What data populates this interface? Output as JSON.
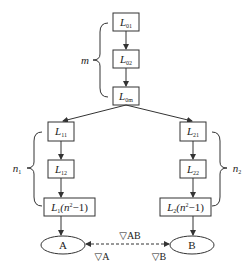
{
  "diagram": {
    "top_chain": {
      "brace_label": "m",
      "nodes": [
        {
          "id": "L01",
          "main": "L",
          "sub": "01"
        },
        {
          "id": "L02",
          "main": "L",
          "sub": "02"
        },
        {
          "id": "L0m",
          "main": "L",
          "sub": "0m"
        }
      ]
    },
    "left_chain": {
      "brace_label": "n",
      "brace_sub": "1",
      "nodes": [
        {
          "id": "L11",
          "main": "L",
          "sub": "11"
        },
        {
          "id": "L12",
          "main": "L",
          "sub": "12"
        },
        {
          "id": "L1n",
          "main": "L",
          "sub": "1",
          "tail_open": "(n",
          "sup": "2",
          "tail_close": "−1)"
        }
      ],
      "terminal": "A"
    },
    "right_chain": {
      "brace_label": "n",
      "brace_sub": "2",
      "nodes": [
        {
          "id": "L21",
          "main": "L",
          "sub": "21"
        },
        {
          "id": "L22",
          "main": "L",
          "sub": "22"
        },
        {
          "id": "L2n",
          "main": "L",
          "sub": "2",
          "tail_open": "(n",
          "sup": "2",
          "tail_close": "−1)"
        }
      ],
      "terminal": "B"
    },
    "link_labels": {
      "ab": "▽AB",
      "a": "▽A",
      "b": "▽B"
    },
    "colors": {
      "stroke": "#333333",
      "text": "#222222",
      "background": "#ffffff"
    }
  }
}
